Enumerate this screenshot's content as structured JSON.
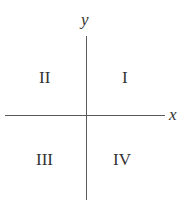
{
  "diagram": {
    "type": "cartesian-quadrants",
    "axes": {
      "x_label": "x",
      "y_label": "y",
      "line_color": "#5a5a5a"
    },
    "quadrants": {
      "q1": "I",
      "q2": "II",
      "q3": "III",
      "q4": "IV"
    }
  }
}
